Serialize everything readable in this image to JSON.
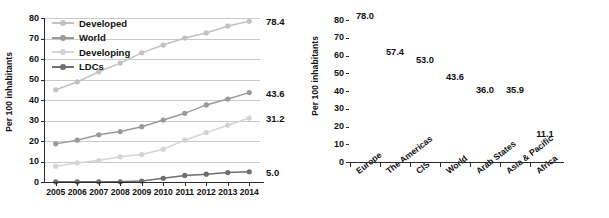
{
  "chart_data": [
    {
      "type": "line",
      "title": "",
      "xlabel": "",
      "ylabel": "Per 100 inhabitants",
      "x": [
        "2005",
        "2006",
        "2007",
        "2008",
        "2009",
        "2010",
        "2011",
        "2012",
        "2013",
        "2014"
      ],
      "ylim": [
        0,
        80
      ],
      "yticks": [
        "0",
        "10",
        "20",
        "30",
        "40",
        "50",
        "60",
        "70",
        "80"
      ],
      "grid": true,
      "legend_position": "top-left",
      "series": [
        {
          "name": "Developed",
          "color": "#c2c2c2",
          "values": [
            45.0,
            48.8,
            53.8,
            58.0,
            63.0,
            66.8,
            70.2,
            72.7,
            76.1,
            78.4
          ],
          "end_label": "78.4"
        },
        {
          "name": "World",
          "color": "#9a9a9a",
          "values": [
            18.6,
            20.4,
            23.0,
            24.6,
            27.0,
            30.2,
            33.5,
            37.6,
            40.5,
            43.6
          ],
          "end_label": "43.6"
        },
        {
          "name": "Developing",
          "color": "#d4d4d4",
          "values": [
            7.7,
            9.3,
            10.5,
            12.3,
            13.4,
            16.0,
            20.4,
            24.1,
            27.7,
            31.2
          ],
          "end_label": "31.2"
        },
        {
          "name": "LDCs",
          "color": "#6e6e6e",
          "values": [
            0.1,
            0.1,
            0.1,
            0.1,
            0.5,
            1.8,
            3.2,
            3.8,
            4.6,
            5.0
          ],
          "end_label": "5.0"
        }
      ]
    },
    {
      "type": "bar",
      "title": "",
      "xlabel": "",
      "ylabel": "Per 100 inhabitants",
      "ylim": [
        0,
        80
      ],
      "yticks": [
        "0",
        "10",
        "20",
        "30",
        "40",
        "50",
        "60",
        "70",
        "80"
      ],
      "grid": true,
      "categories": [
        "Europe",
        "The Americas",
        "CIS",
        "World",
        "Arab States",
        "Asia & Pacific",
        "Africa"
      ],
      "values": [
        78.0,
        57.4,
        53.0,
        43.6,
        36.0,
        35.9,
        11.1
      ],
      "value_labels": [
        "78.0",
        "57.4",
        "53.0",
        "43.6",
        "36.0",
        "35.9",
        "11.1"
      ],
      "colors": [
        "#d8d8d8",
        "#8a8a8a",
        "#dcdcdc",
        "#454545",
        "#d8d8d8",
        "#c9c9c9",
        "#a8a8a8"
      ]
    }
  ]
}
